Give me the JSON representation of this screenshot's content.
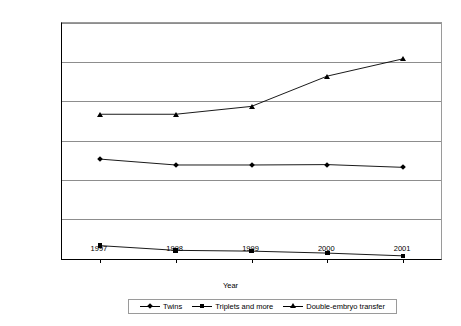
{
  "chart_data": {
    "type": "line",
    "title": "",
    "xlabel": "Year",
    "ylabel": "Percentage",
    "categories": [
      "1997",
      "1998",
      "1999",
      "2000",
      "2001"
    ],
    "ylim": [
      0,
      60
    ],
    "ytick_labels": [
      "0%",
      "10%",
      "20%",
      "30%",
      "40%",
      "50%",
      "60%"
    ],
    "ytick_values": [
      0,
      10,
      20,
      30,
      40,
      50,
      60
    ],
    "grid": true,
    "legend_position": "bottom",
    "series": [
      {
        "name": "Twins",
        "marker": "diamond",
        "color": "#000000",
        "values": [
          25.4,
          23.9,
          23.9,
          24.0,
          23.3
        ]
      },
      {
        "name": "Triplets and more",
        "marker": "square",
        "color": "#000000",
        "values": [
          3.4,
          2.2,
          2.0,
          1.5,
          0.8
        ]
      },
      {
        "name": "Double-embryo transfer",
        "marker": "triangle",
        "color": "#000000",
        "values": [
          36.8,
          36.8,
          38.8,
          46.5,
          50.9
        ]
      }
    ]
  }
}
